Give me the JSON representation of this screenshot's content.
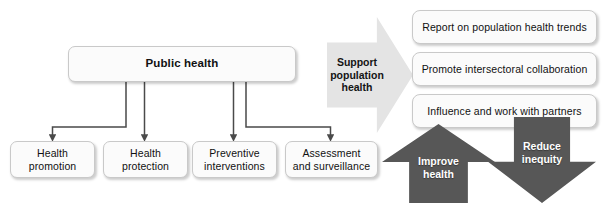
{
  "figure": {
    "type": "flow-diagram",
    "caption": ""
  },
  "root_box": {
    "label": "Public health"
  },
  "leaf_boxes": [
    {
      "label": "Health\npromotion"
    },
    {
      "label": "Health\nprotection"
    },
    {
      "label": "Preventive\ninterventions"
    },
    {
      "label": "Assessment\nand surveillance"
    }
  ],
  "support_arrow": {
    "label": "Support\npopulation\nhealth",
    "direction": "right",
    "fill": "#e4e4e4",
    "text_color": "#141414"
  },
  "outcome_boxes": [
    {
      "label": "Report on population health trends"
    },
    {
      "label": "Promote intersectoral collaboration"
    },
    {
      "label": "Influence and work with partners"
    }
  ],
  "result_arrows": [
    {
      "label": "Improve\nhealth",
      "direction": "up",
      "fill": "#575757",
      "text_color": "#ffffff"
    },
    {
      "label": "Reduce\ninequity",
      "direction": "down",
      "fill": "#575757",
      "text_color": "#ffffff"
    }
  ],
  "style": {
    "box_fill": "#fbfbfb",
    "box_border": "#c9c9c9",
    "connector_color": "#4a4a4a",
    "background": "#ffffff"
  }
}
